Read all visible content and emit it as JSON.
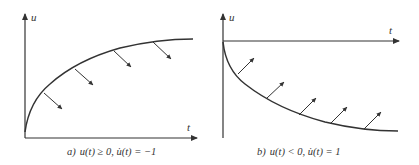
{
  "colors": {
    "ink": "#333333",
    "background": "#ffffff"
  },
  "panels": [
    {
      "id": "a",
      "axis_labels": {
        "y": "u",
        "x": "t"
      },
      "caption": {
        "prefix": "a)",
        "math": "u(t) ≥ 0,  u̇(t) = −1"
      },
      "curve": "concave increasing from origin, approaching horizontal asymptote",
      "arrow_direction": "down-right",
      "arrow_count": 4
    },
    {
      "id": "b",
      "axis_labels": {
        "y": "u",
        "x": "t"
      },
      "caption": {
        "prefix": "b)",
        "math": "u(t) < 0,  u̇(t) = 1"
      },
      "curve": "convex decreasing from origin below t-axis, approaching horizontal asymptote",
      "arrow_direction": "up-right",
      "arrow_count": 5
    }
  ]
}
